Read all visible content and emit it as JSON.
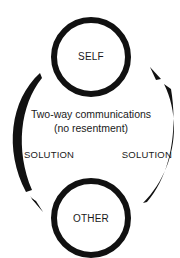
{
  "diagram": {
    "nodes": [
      {
        "id": "self",
        "label": "SELF"
      },
      {
        "id": "other",
        "label": "OTHER"
      }
    ],
    "center_text": {
      "line1": "Two-way communications",
      "line2": "(no resentment)"
    },
    "edges": [
      {
        "from": "self",
        "to": "other",
        "side": "left",
        "label": "SOLUTION"
      },
      {
        "from": "other",
        "to": "self",
        "side": "right",
        "label": "SOLUTION"
      }
    ],
    "colors": {
      "stroke": "#111111",
      "background": "#ffffff"
    }
  }
}
